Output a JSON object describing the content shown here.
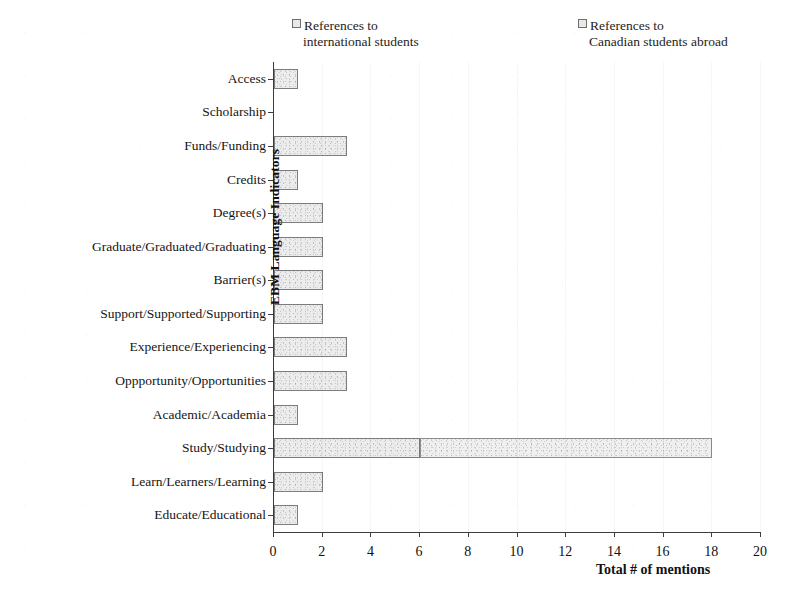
{
  "chart_data": {
    "type": "bar",
    "orientation": "horizontal",
    "stacked": true,
    "title": "",
    "xlabel": "Total # of mentions",
    "ylabel": "EBM Language Indicators",
    "xlim": [
      0,
      20
    ],
    "xticks": [
      0,
      2,
      4,
      6,
      8,
      10,
      12,
      14,
      16,
      18,
      20
    ],
    "grid": false,
    "legend_position": "top",
    "categories": [
      "Access",
      "Scholarship",
      "Funds/Funding",
      "Credits",
      "Degree(s)",
      "Graduate/Graduated/Graduating",
      "Barrier(s)",
      "Support/Supported/Supporting",
      "Experience/Experiencing",
      "Oppportunity/Opportunities",
      "Academic/Academia",
      "Study/Studying",
      "Learn/Learners/Learning",
      "Educate/Educational"
    ],
    "series": [
      {
        "name": "References to international students",
        "values": [
          1,
          0,
          3,
          1,
          2,
          2,
          2,
          2,
          3,
          3,
          1,
          6,
          2,
          1
        ]
      },
      {
        "name": "References to Canadian students abroad",
        "values": [
          0,
          0,
          0,
          0,
          0,
          0,
          0,
          0,
          0,
          0,
          0,
          12,
          0,
          0
        ]
      }
    ],
    "totals": [
      1,
      0,
      3,
      1,
      2,
      2,
      2,
      2,
      3,
      3,
      1,
      18,
      2,
      1
    ]
  },
  "legend": {
    "entries": [
      {
        "line1": "References to",
        "line2": "international students"
      },
      {
        "line1": "References to",
        "line2": "Canadian students abroad"
      }
    ]
  },
  "axes": {
    "x_title": "Total # of mentions",
    "y_title": "EBM Language Indicators"
  },
  "colors": {
    "series1_fill": "#ececec",
    "series1_border": "#7d7d7d",
    "series2_fill": "#efefef",
    "series2_border": "#8d8d8d",
    "axis": "#3d3d3d",
    "text": "#151515"
  }
}
